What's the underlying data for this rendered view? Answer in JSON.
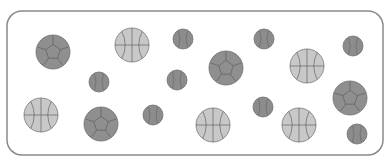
{
  "frame": {
    "x": 7,
    "y": 11,
    "width": 376,
    "height": 144,
    "radius": 15,
    "stroke": "#8a8a8a"
  },
  "colors": {
    "soccer_fill": "#8f8f8f",
    "basketball_fill": "#c8c8c8",
    "baseball_fill": "#8c8c8c",
    "line": "#555555"
  },
  "balls": [
    {
      "type": "soccer",
      "cx": 53,
      "cy": 52,
      "r": 17
    },
    {
      "type": "basketball",
      "cx": 132,
      "cy": 45,
      "r": 17
    },
    {
      "type": "baseball",
      "cx": 183,
      "cy": 39,
      "r": 10
    },
    {
      "type": "baseball",
      "cx": 264,
      "cy": 39,
      "r": 10
    },
    {
      "type": "baseball",
      "cx": 353,
      "cy": 46,
      "r": 10
    },
    {
      "type": "baseball",
      "cx": 99,
      "cy": 82,
      "r": 10
    },
    {
      "type": "baseball",
      "cx": 177,
      "cy": 80,
      "r": 10
    },
    {
      "type": "soccer",
      "cx": 226,
      "cy": 68,
      "r": 17
    },
    {
      "type": "basketball",
      "cx": 307,
      "cy": 66,
      "r": 17
    },
    {
      "type": "soccer",
      "cx": 350,
      "cy": 98,
      "r": 17
    },
    {
      "type": "basketball",
      "cx": 41,
      "cy": 115,
      "r": 17
    },
    {
      "type": "soccer",
      "cx": 101,
      "cy": 124,
      "r": 17
    },
    {
      "type": "baseball",
      "cx": 153,
      "cy": 115,
      "r": 10
    },
    {
      "type": "basketball",
      "cx": 213,
      "cy": 125,
      "r": 17
    },
    {
      "type": "baseball",
      "cx": 263,
      "cy": 107,
      "r": 10
    },
    {
      "type": "basketball",
      "cx": 299,
      "cy": 125,
      "r": 17
    },
    {
      "type": "baseball",
      "cx": 357,
      "cy": 134,
      "r": 10
    }
  ],
  "counts": {
    "soccer": 4,
    "basketball": 5,
    "baseball": 8
  }
}
